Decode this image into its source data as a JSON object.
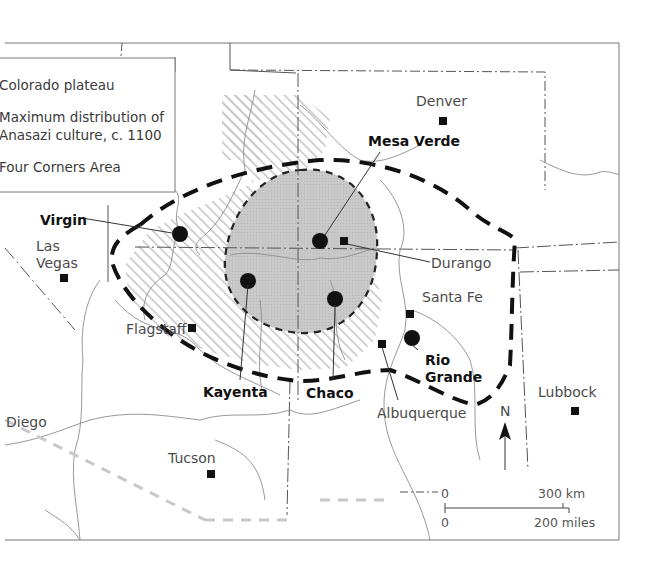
{
  "legend": {
    "items": [
      {
        "label": "Colorado plateau",
        "symbol": "diagonal-hatch"
      },
      {
        "label_line1": "Maximum distribution of",
        "label_line2": "Anasazi culture, c. 1100",
        "symbol": "thick-dashed-line"
      },
      {
        "label": "Four Corners Area",
        "symbol": "grey-shaded-area"
      }
    ],
    "visible_text": [
      "Colorado plateau",
      "Maximum distribution of",
      "Anasazi culture, c. 1100",
      "Four Corners Area"
    ]
  },
  "cities": [
    {
      "name": "Denver"
    },
    {
      "name": "Las",
      "name2": "Vegas"
    },
    {
      "name": "Flagstaff"
    },
    {
      "name": "Durango"
    },
    {
      "name": "Santa Fe"
    },
    {
      "name": "Albuquerque"
    },
    {
      "name": "Lubbock"
    },
    {
      "name": "Tucson"
    },
    {
      "name": "Diego"
    }
  ],
  "sites": [
    {
      "name": "Mesa Verde"
    },
    {
      "name": "Virgin"
    },
    {
      "name": "Kayenta"
    },
    {
      "name": "Chaco"
    },
    {
      "name": "Rio",
      "name2": "Grande"
    }
  ],
  "north_arrow": {
    "label": "N"
  },
  "scale_bar": {
    "top_zero": "0",
    "top_max": "300 km",
    "bottom_zero": "0",
    "bottom_max": "200 miles"
  },
  "colors": {
    "hatch": "#bdbdbd",
    "four_corners_fill": "#c8c8c8",
    "boundary_dash": "#111111",
    "rivers": "#8a8a8a",
    "borders": "#555555",
    "frame": "#777777"
  }
}
